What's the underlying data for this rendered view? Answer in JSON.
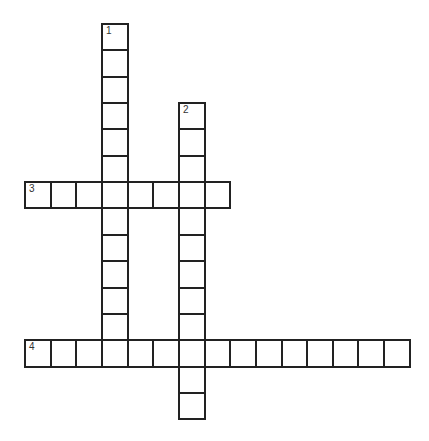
{
  "puzzle": {
    "origin": {
      "x": 24,
      "y": 23
    },
    "cell_w": 25.65,
    "cell_h": 26.35,
    "words": [
      {
        "number": "1",
        "direction": "down",
        "col": 3,
        "row": 0,
        "length": 12
      },
      {
        "number": "2",
        "direction": "down",
        "col": 6,
        "row": 3,
        "length": 12
      },
      {
        "number": "3",
        "direction": "across",
        "col": 0,
        "row": 6,
        "length": 8
      },
      {
        "number": "4",
        "direction": "across",
        "col": 0,
        "row": 12,
        "length": 15
      }
    ]
  }
}
